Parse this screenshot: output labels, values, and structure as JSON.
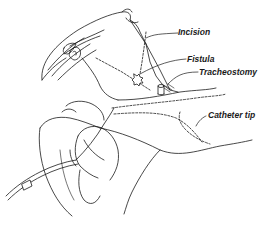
{
  "diagram": {
    "labels": [
      {
        "id": "incision",
        "text": "Incision"
      },
      {
        "id": "fistula",
        "text": "Fistula"
      },
      {
        "id": "tracheostomy",
        "text": "Tracheostomy"
      },
      {
        "id": "catheter_tip",
        "text": "Catheter tip"
      }
    ],
    "colors": {
      "ink": "#1a1a1a",
      "background": "#ffffff"
    }
  }
}
